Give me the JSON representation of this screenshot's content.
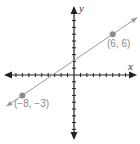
{
  "chart_data": {
    "type": "line",
    "title": "",
    "xlabel": "x",
    "ylabel": "y",
    "grid": false,
    "x_ticks_every": 1,
    "y_ticks_every": 1,
    "xlim": [
      -11,
      10
    ],
    "ylim": [
      -10,
      11
    ],
    "series": [
      {
        "name": "line",
        "x": [
          -8,
          6
        ],
        "y": [
          -3,
          6
        ],
        "color": "#9a9a9a",
        "extends_both_directions": true
      }
    ],
    "points": [
      {
        "x": -8,
        "y": -3,
        "label": "(−8, −3)"
      },
      {
        "x": 6,
        "y": 6,
        "label": "(6, 6)"
      }
    ]
  },
  "labels": {
    "x_axis": "x",
    "y_axis": "y",
    "point_a": "(−8, −3)",
    "point_b": "(6, 6)"
  },
  "colors": {
    "axis": "#222222",
    "line": "#9a9a9a",
    "point": "#8c8c8c",
    "label": "#8a8a8a"
  }
}
